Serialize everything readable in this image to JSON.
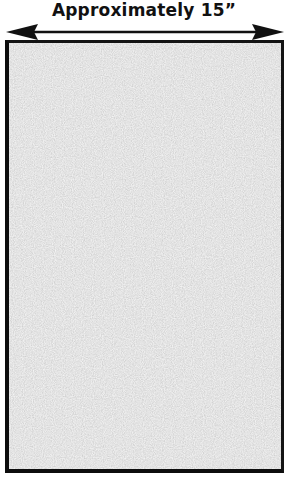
{
  "diagram": {
    "dimension_label": "Approximately 15”",
    "dimension_direction": "horizontal",
    "arrow": {
      "type": "double-headed",
      "color": "#111111"
    },
    "panel": {
      "fill": "#c9c9c9",
      "texture": "speckled-gray",
      "border_color": "#111111"
    }
  }
}
